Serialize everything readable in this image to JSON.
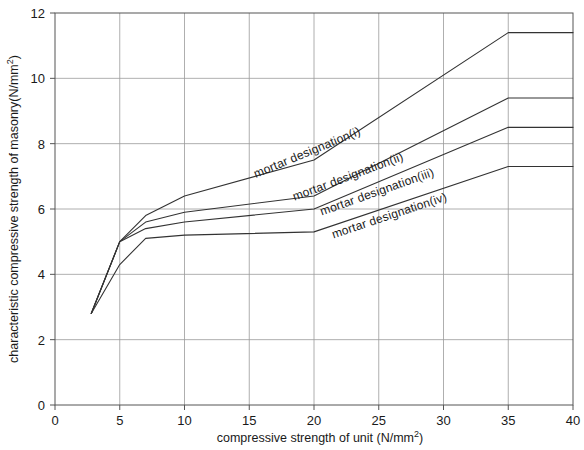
{
  "chart_data": {
    "type": "line",
    "title": "",
    "xlabel": "compressive strength of unit (N/mm2)",
    "xlabel_base": "compressive strength of unit (N/mm",
    "xlabel_sup": "2",
    "xlabel_tail": ")",
    "ylabel": "characteristic compressive strength of masonry(N/mm2)",
    "ylabel_base": "characteristic compressive strength of masonry(N/mm",
    "ylabel_sup": "2",
    "ylabel_tail": ")",
    "xlim": [
      0,
      40
    ],
    "ylim": [
      0,
      12
    ],
    "xticks": [
      0,
      5,
      10,
      15,
      20,
      25,
      30,
      35,
      40
    ],
    "xtick_labels": [
      "0",
      "5",
      "10",
      "15",
      "20",
      "25",
      "30",
      "35",
      "40"
    ],
    "yticks": [
      0,
      2,
      4,
      6,
      8,
      10,
      12
    ],
    "ytick_labels": [
      "0",
      "2",
      "4",
      "6",
      "8",
      "10",
      "12"
    ],
    "grid": true,
    "legend_position": "inline-along-curves",
    "series": [
      {
        "name": "mortar designation(i)",
        "label": "mortar designation(i)",
        "x": [
          2.8,
          5,
          7,
          10,
          20,
          35,
          40
        ],
        "y": [
          2.8,
          5.0,
          5.8,
          6.4,
          7.5,
          11.4,
          11.4
        ]
      },
      {
        "name": "mortar designation(ii)",
        "label": "mortar designation(ii)",
        "x": [
          2.8,
          5,
          7,
          10,
          20,
          35,
          40
        ],
        "y": [
          2.8,
          5.0,
          5.6,
          5.9,
          6.4,
          9.4,
          9.4
        ]
      },
      {
        "name": "mortar designation(iii)",
        "label": "mortar designation(iii)",
        "x": [
          2.8,
          5,
          7,
          10,
          20,
          35,
          40
        ],
        "y": [
          2.8,
          5.0,
          5.4,
          5.6,
          6.0,
          8.5,
          8.5
        ]
      },
      {
        "name": "mortar designation(iv)",
        "label": "mortar designation(iv)",
        "x": [
          2.8,
          5,
          7,
          10,
          20,
          35,
          40
        ],
        "y": [
          2.8,
          4.3,
          5.1,
          5.2,
          5.3,
          7.3,
          7.3
        ]
      }
    ]
  },
  "labels": {
    "series_1": "mortar designation(i)",
    "series_2": "mortar designation(ii)",
    "series_3": "mortar designation(iii)",
    "series_4": "mortar designation(iv)"
  },
  "colors": {
    "curve": "#333333",
    "grid": "#9a9a9a",
    "axis": "#555555",
    "text": "#1a1a1a",
    "background": "#ffffff"
  }
}
